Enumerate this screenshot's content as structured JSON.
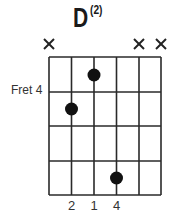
{
  "chord": {
    "name": "D",
    "variant": "(2)",
    "start_fret_label": "Fret 4",
    "strings": 6,
    "frets_shown": 4,
    "muted_strings": [
      1,
      5,
      6
    ],
    "muted_symbol": "×",
    "dots": [
      {
        "string": 3,
        "fret_row": 1
      },
      {
        "string": 2,
        "fret_row": 2
      },
      {
        "string": 4,
        "fret_row": 4
      }
    ],
    "fingers": [
      {
        "string": 2,
        "label": "2"
      },
      {
        "string": 3,
        "label": "1"
      },
      {
        "string": 4,
        "label": "4"
      }
    ]
  },
  "colors": {
    "line": "#2a2a2a",
    "dot": "#111111",
    "text": "#333333"
  }
}
